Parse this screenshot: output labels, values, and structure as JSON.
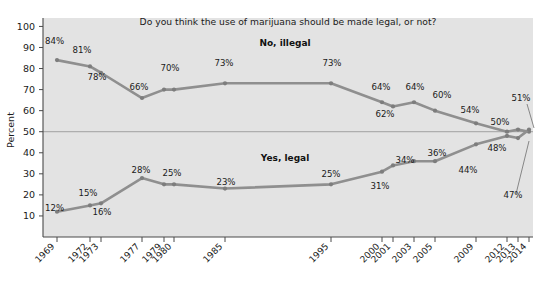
{
  "chart_data": {
    "type": "line",
    "title": "Do you think the use of marijuana should be made legal, or not?",
    "xlabel": "",
    "ylabel": "Percent",
    "ylim": [
      0,
      100
    ],
    "yticks": [
      10,
      20,
      30,
      40,
      50,
      60,
      70,
      80,
      90,
      100
    ],
    "grid": "single horizontal reference line at 50",
    "gridlines": [
      50
    ],
    "legend_position": "inline-labels",
    "categories": [
      "1969",
      "1972",
      "1973",
      "1977",
      "1979",
      "1980",
      "1985",
      "1995",
      "2000",
      "2001",
      "2003",
      "2005",
      "2009",
      "2012",
      "2013",
      "2014"
    ],
    "series": [
      {
        "name": "No, illegal",
        "values": [
          84,
          81,
          78,
          66,
          70,
          70,
          73,
          73,
          64,
          62,
          64,
          60,
          54,
          50,
          51,
          50
        ],
        "labels": [
          "84%",
          "81%",
          "78%",
          "66%",
          "70%",
          "",
          "73%",
          "73%",
          "64%",
          "62%",
          "64%",
          "60%",
          "54%",
          "50%",
          "51%",
          ""
        ]
      },
      {
        "name": "Yes, legal",
        "values": [
          12,
          15,
          16,
          28,
          25,
          25,
          23,
          25,
          31,
          34,
          36,
          36,
          44,
          48,
          47,
          51
        ],
        "labels": [
          "12%",
          "15%",
          "16%",
          "28%",
          "25%",
          "",
          "23%",
          "25%",
          "31%",
          "34%",
          "36%",
          "",
          "44%",
          "48%",
          "47%",
          ""
        ]
      }
    ],
    "series_labels": [
      {
        "text": "No, illegal",
        "x": 285,
        "y": 46
      },
      {
        "text": "Yes, legal",
        "x": 285,
        "y": 161
      }
    ],
    "point_labels": [
      {
        "text": "84%",
        "x": 45,
        "y": 44,
        "anchor": "start"
      },
      {
        "text": "81%",
        "x": 82,
        "y": 53,
        "anchor": "middle"
      },
      {
        "text": "78%",
        "x": 97,
        "y": 80,
        "anchor": "middle"
      },
      {
        "text": "66%",
        "x": 139,
        "y": 90,
        "anchor": "middle"
      },
      {
        "text": "70%",
        "x": 170,
        "y": 71,
        "anchor": "middle"
      },
      {
        "text": "73%",
        "x": 224,
        "y": 66,
        "anchor": "middle"
      },
      {
        "text": "73%",
        "x": 332,
        "y": 66,
        "anchor": "middle"
      },
      {
        "text": "64%",
        "x": 381,
        "y": 90,
        "anchor": "middle"
      },
      {
        "text": "62%",
        "x": 385,
        "y": 117,
        "anchor": "middle"
      },
      {
        "text": "64%",
        "x": 415,
        "y": 90,
        "anchor": "middle"
      },
      {
        "text": "60%",
        "x": 442,
        "y": 98,
        "anchor": "middle"
      },
      {
        "text": "54%",
        "x": 470,
        "y": 113,
        "anchor": "middle"
      },
      {
        "text": "50%",
        "x": 500,
        "y": 125,
        "anchor": "middle"
      },
      {
        "text": "51%",
        "x": 521,
        "y": 101,
        "anchor": "middle"
      },
      {
        "text": "12%",
        "x": 45,
        "y": 211,
        "anchor": "start"
      },
      {
        "text": "15%",
        "x": 88,
        "y": 196,
        "anchor": "middle"
      },
      {
        "text": "16%",
        "x": 102,
        "y": 215,
        "anchor": "middle"
      },
      {
        "text": "28%",
        "x": 141,
        "y": 173,
        "anchor": "middle"
      },
      {
        "text": "25%",
        "x": 172,
        "y": 176,
        "anchor": "middle"
      },
      {
        "text": "23%",
        "x": 226,
        "y": 185,
        "anchor": "middle"
      },
      {
        "text": "25%",
        "x": 331,
        "y": 177,
        "anchor": "middle"
      },
      {
        "text": "31%",
        "x": 380,
        "y": 189,
        "anchor": "middle"
      },
      {
        "text": "34%",
        "x": 405,
        "y": 163,
        "anchor": "middle"
      },
      {
        "text": "36%",
        "x": 437,
        "y": 156,
        "anchor": "middle"
      },
      {
        "text": "44%",
        "x": 468,
        "y": 173,
        "anchor": "middle"
      },
      {
        "text": "48%",
        "x": 497,
        "y": 151,
        "anchor": "middle"
      },
      {
        "text": "47%",
        "x": 513,
        "y": 198,
        "anchor": "middle"
      }
    ],
    "leaders": [
      {
        "x1": 527,
        "y1": 104,
        "x2": 534,
        "y2": 128
      },
      {
        "x1": 516,
        "y1": 194,
        "x2": 529,
        "y2": 141
      }
    ]
  },
  "axis": {
    "y_title": "Percent",
    "y_ticks": [
      "100",
      "90",
      "80",
      "70",
      "60",
      "50",
      "40",
      "30",
      "20",
      "10"
    ],
    "x_ticks": [
      {
        "label": "1969",
        "x": 57
      },
      {
        "label": "1972",
        "x": 90
      },
      {
        "label": "1973",
        "x": 101
      },
      {
        "label": "1977",
        "x": 142
      },
      {
        "label": "1979",
        "x": 164
      },
      {
        "label": "1980",
        "x": 174
      },
      {
        "label": "1985",
        "x": 225
      },
      {
        "label": "1995",
        "x": 331
      },
      {
        "label": "2000",
        "x": 382
      },
      {
        "label": "2001",
        "x": 393
      },
      {
        "label": "2003",
        "x": 414
      },
      {
        "label": "2005",
        "x": 435
      },
      {
        "label": "2009",
        "x": 476
      },
      {
        "label": "2012",
        "x": 507
      },
      {
        "label": "2013",
        "x": 518
      },
      {
        "label": "2014",
        "x": 529
      }
    ]
  },
  "colors": {
    "plot_background": "#e3e3e3",
    "line": "#8f8f8f",
    "marker": "#7d7d7d",
    "axis": "#4a4a4a",
    "text": "#1a1a1a",
    "gridline": "#9a9a9a"
  }
}
